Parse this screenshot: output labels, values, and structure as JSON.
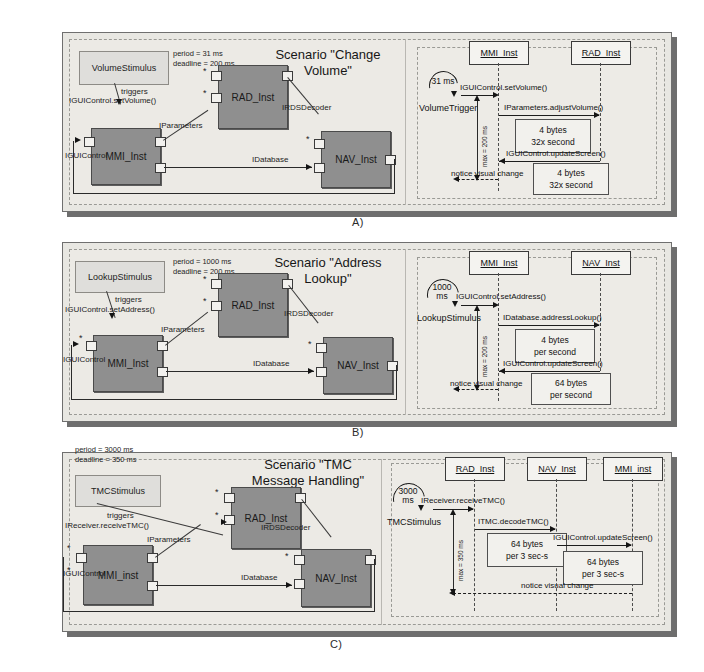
{
  "figure": {
    "panels": [
      {
        "letter": "A)",
        "title": "Scenario \"Change\nVolume\"",
        "meta": "period    = 31 ms\ndeadline = 200 ms",
        "period": "31 ms",
        "deadline": "200 ms",
        "component_diagram": {
          "stimulus": "VolumeStimulus",
          "components": [
            "RAD_Inst",
            "MMI_Inst",
            "NAV_Inst"
          ],
          "connector_labels": [
            "triggers",
            "IGUIControl.setVolume()",
            "IParameters",
            "IRDSDecoder",
            "IDatabase",
            "IGUIControl"
          ]
        },
        "sequence_diagram": {
          "actors": [
            "MMI_Inst",
            "RAD_Inst"
          ],
          "trigger_value": "31 ms",
          "trigger_name": "VolumeTrigger",
          "deadline_label": "max = 200 ms",
          "messages": [
            "IGUIControl.setVolume()",
            "IParameters.adjustVolume()",
            "IGUIControl.updateScreen()",
            "notice visual change"
          ],
          "notes": [
            {
              "line1": "4 bytes",
              "line2": "32x second"
            },
            {
              "line1": "4 bytes",
              "line2": "32x second"
            }
          ]
        }
      },
      {
        "letter": "B)",
        "title": "Scenario \"Address\nLookup\"",
        "meta": "period    = 1000 ms\ndeadline = 200 ms",
        "period": "1000 ms",
        "deadline": "200 ms",
        "component_diagram": {
          "stimulus": "LookupStimulus",
          "components": [
            "RAD_Inst",
            "MMI_Inst",
            "NAV_Inst"
          ],
          "connector_labels": [
            "triggers",
            "IGUIControl.setAddress()",
            "IParameters",
            "IRDSDecoder",
            "IDatabase",
            "IGUIControl"
          ]
        },
        "sequence_diagram": {
          "actors": [
            "MMI_Inst",
            "NAV_Inst"
          ],
          "trigger_value": "1000\nms",
          "trigger_name": "LookupStimulus",
          "deadline_label": "max = 200 ms",
          "messages": [
            "IGUIControl.setAddress()",
            "IDatabase.addressLookup()",
            "IGUIControl.updateScreen()",
            "notice visual change"
          ],
          "notes": [
            {
              "line1": "4 bytes",
              "line2": "per second"
            },
            {
              "line1": "64 bytes",
              "line2": "per second"
            }
          ]
        }
      },
      {
        "letter": "C)",
        "title": "Scenario \"TMC\nMessage Handling\"",
        "meta": "period    = 3000 ms\ndeadline = 350 ms",
        "period": "3000 ms",
        "deadline": "350 ms",
        "component_diagram": {
          "stimulus": "TMCStimulus",
          "components": [
            "RAD_Inst",
            "MMI_inst",
            "NAV_Inst"
          ],
          "connector_labels": [
            "triggers",
            "IReceiver.receiveTMC()",
            "IParameters",
            "IRDSDecoder",
            "IDatabase",
            "IGUIControl"
          ]
        },
        "sequence_diagram": {
          "actors": [
            "RAD_Inst",
            "NAV_Inst",
            "MMI_inst"
          ],
          "trigger_value": "3000\nms",
          "trigger_name": "TMCStimulus",
          "deadline_label": "max = 350 ms",
          "messages": [
            "IReceiver.receiveTMC()",
            "ITMC.decodeTMC()",
            "IGUIControl.updateScreen()",
            "notice visual change"
          ],
          "notes": [
            {
              "line1": "64 bytes",
              "line2": "per 3 sec-s"
            },
            {
              "line1": "64 bytes",
              "line2": "per 3 sec-s"
            }
          ]
        }
      }
    ],
    "colors": {
      "component_fill": "#8f8f8f",
      "panel_fill": "#e8e7e2",
      "shadow": "#6e6e6e",
      "line": "#1d1d1d"
    }
  }
}
